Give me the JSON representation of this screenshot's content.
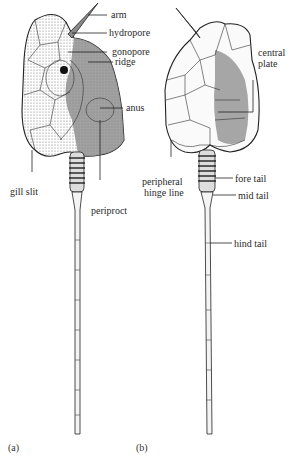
{
  "figure": {
    "panels": [
      {
        "id": "a",
        "caption": "(a)",
        "labels": {
          "arm": "arm",
          "hydropore": "hydropore",
          "gonopore": "gonopore",
          "ridge": "ridge",
          "anus": "anus",
          "gill_slit": "gill slit",
          "periproct": "periproct"
        }
      },
      {
        "id": "b",
        "caption": "(b)",
        "labels": {
          "central_plate_1": "central",
          "central_plate_2": "plate",
          "peripheral_hinge_line_1": "peripheral",
          "peripheral_hinge_line_2": "hinge line",
          "fore_tail": "fore tail",
          "mid_tail": "mid tail",
          "hind_tail": "hind tail"
        }
      }
    ]
  }
}
